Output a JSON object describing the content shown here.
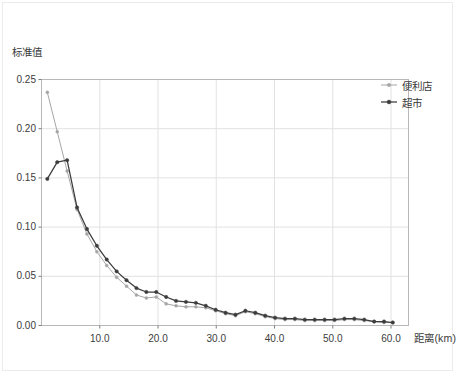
{
  "chart_data": {
    "type": "line",
    "title": "",
    "subtitle": "",
    "xlabel": "距离(km)",
    "ylabel": "标准值",
    "xlim": [
      0.0,
      63.0
    ],
    "ylim": [
      0.0,
      0.25
    ],
    "xticks": [
      "10.0",
      "20.0",
      "30.0",
      "40.0",
      "50.0",
      "60.0"
    ],
    "xtick_values": [
      10.0,
      20.0,
      30.0,
      40.0,
      50.0,
      60.0
    ],
    "yticks": [
      "0.00",
      "0.05",
      "0.10",
      "0.15",
      "0.20",
      "0.25"
    ],
    "ytick_values": [
      0.0,
      0.05,
      0.1,
      0.15,
      0.2,
      0.25
    ],
    "grid": true,
    "grid_color": "#e2e2e4",
    "legend_position": "top-right",
    "series": [
      {
        "name": "便利店",
        "color": "#a6a6a6",
        "marker": "circle",
        "x": [
          1.0,
          2.7,
          4.4,
          6.1,
          7.8,
          9.5,
          11.2,
          12.9,
          14.6,
          16.3,
          18.0,
          19.7,
          21.4,
          23.1,
          24.8,
          26.5,
          28.2,
          29.9,
          31.6,
          33.3,
          35.0,
          36.7,
          38.4,
          40.1,
          41.8,
          43.5,
          45.2,
          46.9,
          48.6,
          50.3,
          52.0,
          53.7,
          55.4,
          57.1,
          58.8,
          60.3
        ],
        "values": [
          0.237,
          0.197,
          0.157,
          0.118,
          0.093,
          0.075,
          0.061,
          0.049,
          0.04,
          0.031,
          0.028,
          0.029,
          0.022,
          0.02,
          0.019,
          0.019,
          0.018,
          0.015,
          0.012,
          0.01,
          0.014,
          0.012,
          0.009,
          0.007,
          0.006,
          0.006,
          0.005,
          0.005,
          0.005,
          0.005,
          0.006,
          0.006,
          0.005,
          0.004,
          0.003,
          0.003
        ]
      },
      {
        "name": "超市",
        "color": "#3c3c3c",
        "marker": "circle",
        "x": [
          1.0,
          2.7,
          4.4,
          6.1,
          7.8,
          9.5,
          11.2,
          12.9,
          14.6,
          16.3,
          18.0,
          19.7,
          21.4,
          23.1,
          24.8,
          26.5,
          28.2,
          29.9,
          31.6,
          33.3,
          35.0,
          36.7,
          38.4,
          40.1,
          41.8,
          43.5,
          45.2,
          46.9,
          48.6,
          50.3,
          52.0,
          53.7,
          55.4,
          57.1,
          58.8,
          60.3
        ],
        "values": [
          0.149,
          0.166,
          0.168,
          0.12,
          0.098,
          0.081,
          0.067,
          0.055,
          0.046,
          0.038,
          0.034,
          0.034,
          0.029,
          0.025,
          0.024,
          0.023,
          0.02,
          0.016,
          0.013,
          0.011,
          0.015,
          0.013,
          0.01,
          0.008,
          0.007,
          0.007,
          0.006,
          0.006,
          0.006,
          0.006,
          0.007,
          0.007,
          0.006,
          0.004,
          0.004,
          0.003
        ]
      }
    ]
  },
  "legend": {
    "items": [
      {
        "label": "便利店"
      },
      {
        "label": "超市"
      }
    ]
  }
}
